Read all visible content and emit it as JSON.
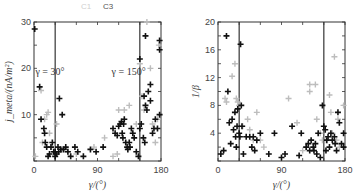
{
  "legend": {
    "entries": [
      {
        "label": "C1",
        "color": "#bdbdbd"
      },
      {
        "label": "C3",
        "color": "#111111"
      }
    ]
  },
  "chart_data": [
    {
      "type": "scatter",
      "panel": "left",
      "title": "",
      "xlabel": "γ/(°)",
      "ylabel": "j_meta/(nA/m²)",
      "xlim": [
        0,
        180
      ],
      "ylim": [
        0,
        30
      ],
      "xticks": [
        "0",
        "90",
        "180"
      ],
      "yticks": [
        "10",
        "20",
        "30"
      ],
      "vlines": [
        30,
        150
      ],
      "annotations": [
        {
          "text": "γ = 30°",
          "x": 2,
          "y": 19.5
        },
        {
          "text": "γ = 150°",
          "x": 110,
          "y": 19.5
        }
      ],
      "series": [
        {
          "name": "C1",
          "color": "#bdbdbd",
          "points": [
            [
              2,
              1
            ],
            [
              10,
              15.2
            ],
            [
              12,
              4
            ],
            [
              15,
              9
            ],
            [
              18,
              10
            ],
            [
              20,
              10.5
            ],
            [
              22,
              6
            ],
            [
              25,
              3
            ],
            [
              28,
              2
            ],
            [
              32,
              8
            ],
            [
              40,
              2.5
            ],
            [
              48,
              2
            ],
            [
              60,
              1.5
            ],
            [
              85,
              3
            ],
            [
              100,
              5
            ],
            [
              112,
              1
            ],
            [
              118,
              1.5
            ],
            [
              120,
              11
            ],
            [
              128,
              11
            ],
            [
              135,
              12
            ],
            [
              140,
              6
            ],
            [
              145,
              8
            ],
            [
              150,
              21
            ],
            [
              153,
              14
            ],
            [
              156,
              11
            ],
            [
              160,
              30
            ],
            [
              165,
              20
            ],
            [
              168,
              8
            ],
            [
              172,
              4
            ],
            [
              175,
              9
            ],
            [
              177,
              25
            ]
          ]
        },
        {
          "name": "C3",
          "color": "#111111",
          "points": [
            [
              1,
              28.5
            ],
            [
              8,
              16
            ],
            [
              10,
              9
            ],
            [
              14,
              7
            ],
            [
              15,
              6
            ],
            [
              16,
              4
            ],
            [
              18,
              3
            ],
            [
              20,
              1
            ],
            [
              22,
              1.5
            ],
            [
              24,
              3
            ],
            [
              26,
              4
            ],
            [
              28,
              2
            ],
            [
              30,
              1
            ],
            [
              30,
              2
            ],
            [
              32,
              1.5
            ],
            [
              34,
              3
            ],
            [
              35,
              2
            ],
            [
              36,
              13.5
            ],
            [
              38,
              2.5
            ],
            [
              40,
              10
            ],
            [
              42,
              2.5
            ],
            [
              45,
              3
            ],
            [
              48,
              2
            ],
            [
              52,
              1
            ],
            [
              58,
              3
            ],
            [
              62,
              2
            ],
            [
              70,
              1
            ],
            [
              80,
              2.5
            ],
            [
              88,
              2
            ],
            [
              98,
              3
            ],
            [
              112,
              7
            ],
            [
              115,
              6
            ],
            [
              118,
              5.5
            ],
            [
              120,
              7.5
            ],
            [
              122,
              8
            ],
            [
              124,
              8.5
            ],
            [
              125,
              6
            ],
            [
              126,
              5
            ],
            [
              127,
              8
            ],
            [
              128,
              9
            ],
            [
              130,
              4
            ],
            [
              132,
              3
            ],
            [
              133,
              2.5
            ],
            [
              135,
              4
            ],
            [
              136,
              3
            ],
            [
              138,
              7
            ],
            [
              140,
              6
            ],
            [
              142,
              5
            ],
            [
              145,
              2
            ],
            [
              148,
              1
            ],
            [
              150,
              7
            ],
            [
              150,
              22
            ],
            [
              152,
              8
            ],
            [
              155,
              5
            ],
            [
              156,
              14
            ],
            [
              157,
              4
            ],
            [
              158,
              12
            ],
            [
              158,
              27
            ],
            [
              160,
              11
            ],
            [
              162,
              15
            ],
            [
              165,
              16.5
            ],
            [
              165,
              13
            ],
            [
              168,
              6
            ],
            [
              170,
              7
            ],
            [
              172,
              9
            ],
            [
              175,
              7
            ],
            [
              178,
              24
            ],
            [
              178,
              26
            ],
            [
              178,
              10
            ]
          ]
        }
      ]
    },
    {
      "type": "scatter",
      "panel": "right",
      "title": "",
      "xlabel": "γ/(°)",
      "ylabel": "1/β",
      "xlim": [
        0,
        180
      ],
      "ylim": [
        0,
        20
      ],
      "xticks": [
        "0",
        "90",
        "180"
      ],
      "yticks": [
        "4",
        "8",
        "12",
        "16",
        "20"
      ],
      "vlines": [
        30,
        150
      ],
      "series": [
        {
          "name": "C1",
          "color": "#bdbdbd",
          "points": [
            [
              10,
              9
            ],
            [
              12,
              8.5
            ],
            [
              20,
              12.2
            ],
            [
              24,
              14
            ],
            [
              26,
              9
            ],
            [
              28,
              8.5
            ],
            [
              30,
              8
            ],
            [
              35,
              5
            ],
            [
              42,
              6
            ],
            [
              45,
              4.5
            ],
            [
              50,
              3
            ],
            [
              55,
              7
            ],
            [
              60,
              3
            ],
            [
              65,
              2
            ],
            [
              100,
              9
            ],
            [
              112,
              5.5
            ],
            [
              120,
              1.5
            ],
            [
              125,
              2
            ],
            [
              130,
              11
            ],
            [
              130,
              10
            ],
            [
              138,
              11
            ],
            [
              140,
              6
            ],
            [
              145,
              4
            ],
            [
              148,
              3
            ],
            [
              155,
              3
            ],
            [
              158,
              9.5
            ],
            [
              160,
              7
            ],
            [
              162,
              4
            ],
            [
              165,
              15
            ],
            [
              168,
              3
            ],
            [
              170,
              6
            ],
            [
              172,
              2
            ],
            [
              178,
              8
            ]
          ]
        },
        {
          "name": "C3",
          "color": "#111111",
          "points": [
            [
              4,
              1
            ],
            [
              8,
              1.5
            ],
            [
              12,
              18
            ],
            [
              14,
              10
            ],
            [
              16,
              5.5
            ],
            [
              18,
              2.5
            ],
            [
              20,
              6
            ],
            [
              22,
              4.5
            ],
            [
              24,
              7
            ],
            [
              25,
              3.5
            ],
            [
              26,
              2
            ],
            [
              27,
              5
            ],
            [
              28,
              7.5
            ],
            [
              30,
              4
            ],
            [
              31,
              3.5
            ],
            [
              32,
              16.8
            ],
            [
              33,
              8
            ],
            [
              34,
              5
            ],
            [
              36,
              1
            ],
            [
              40,
              3.5
            ],
            [
              45,
              3.5
            ],
            [
              48,
              2
            ],
            [
              50,
              3.5
            ],
            [
              52,
              1.5
            ],
            [
              55,
              3
            ],
            [
              60,
              4
            ],
            [
              72,
              1
            ],
            [
              80,
              4
            ],
            [
              90,
              0.5
            ],
            [
              95,
              1
            ],
            [
              105,
              5
            ],
            [
              115,
              0.8
            ],
            [
              118,
              4
            ],
            [
              125,
              2
            ],
            [
              128,
              2.5
            ],
            [
              130,
              1.5
            ],
            [
              132,
              3
            ],
            [
              135,
              2
            ],
            [
              136,
              1.5
            ],
            [
              138,
              2.5
            ],
            [
              140,
              1
            ],
            [
              142,
              4
            ],
            [
              145,
              0.5
            ],
            [
              148,
              8
            ],
            [
              150,
              5
            ],
            [
              152,
              4.5
            ],
            [
              153,
              1.5
            ],
            [
              154,
              3
            ],
            [
              156,
              3.5
            ],
            [
              158,
              2
            ],
            [
              160,
              4
            ],
            [
              162,
              3
            ],
            [
              165,
              3.5
            ],
            [
              166,
              2.5
            ],
            [
              168,
              1.5
            ],
            [
              170,
              7
            ],
            [
              172,
              5.5
            ],
            [
              175,
              2.5
            ],
            [
              178,
              4
            ],
            [
              178,
              2
            ]
          ]
        }
      ]
    }
  ]
}
